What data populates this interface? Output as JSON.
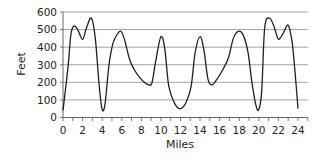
{
  "chart_data": {
    "type": "line",
    "title": "",
    "xlabel": "Miles",
    "ylabel": "Feet",
    "xlim": [
      0,
      25
    ],
    "ylim": [
      0,
      600
    ],
    "x_ticks": [
      0,
      2,
      4,
      6,
      8,
      10,
      12,
      14,
      16,
      18,
      20,
      22,
      24
    ],
    "y_ticks": [
      0,
      100,
      200,
      300,
      400,
      500,
      600
    ],
    "grid": {
      "horizontal": true,
      "vertical": false
    },
    "legend": null,
    "series": [
      {
        "name": "Elevation",
        "color": "#231f20",
        "x": [
          0,
          0.5,
          0.8,
          1.1,
          1.5,
          2.0,
          2.4,
          2.9,
          3.3,
          3.7,
          4.0,
          4.3,
          4.7,
          5.1,
          5.5,
          5.9,
          6.3,
          6.8,
          7.3,
          7.8,
          8.3,
          8.8,
          9.1,
          9.5,
          10.0,
          10.4,
          10.8,
          11.4,
          12.0,
          12.6,
          13.1,
          13.5,
          14.0,
          14.4,
          14.8,
          15.2,
          15.7,
          16.3,
          16.9,
          17.4,
          17.9,
          18.4,
          18.9,
          19.3,
          19.7,
          20.0,
          20.3,
          20.6,
          21.1,
          21.6,
          22.0,
          22.5,
          23.0,
          23.4,
          23.7,
          24.0
        ],
        "y": [
          40,
          280,
          470,
          520,
          500,
          445,
          510,
          565,
          450,
          180,
          45,
          80,
          300,
          420,
          470,
          490,
          440,
          330,
          270,
          230,
          200,
          185,
          200,
          330,
          460,
          390,
          180,
          80,
          50,
          90,
          180,
          370,
          460,
          380,
          220,
          185,
          215,
          270,
          340,
          450,
          490,
          470,
          370,
          200,
          70,
          45,
          150,
          510,
          565,
          510,
          445,
          480,
          525,
          430,
          260,
          50
        ]
      }
    ]
  },
  "labels": {
    "xlabel": "Miles",
    "ylabel": "Feet",
    "x_tick_labels": [
      "0",
      "2",
      "4",
      "6",
      "8",
      "10",
      "12",
      "14",
      "16",
      "18",
      "20",
      "22",
      "24"
    ],
    "y_tick_labels": [
      "0",
      "100",
      "200",
      "300",
      "400",
      "500",
      "600"
    ]
  }
}
